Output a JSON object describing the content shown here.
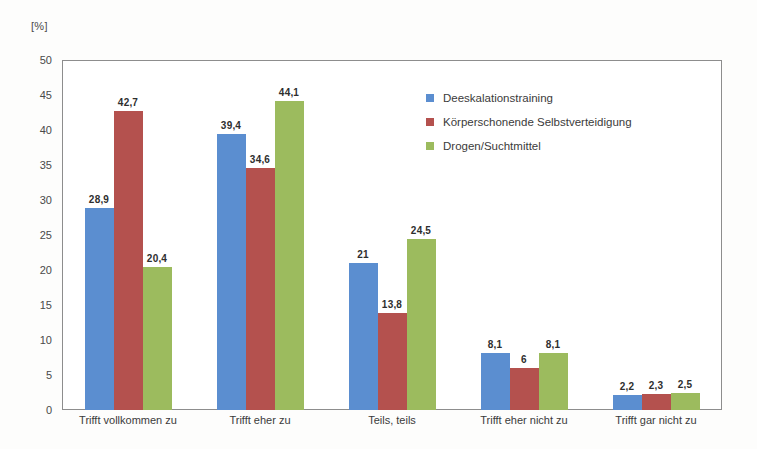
{
  "unit_label": "[%]",
  "chart_data": {
    "type": "bar",
    "title": "",
    "subtitle": "",
    "xlabel": "",
    "ylabel": "[%]",
    "ylim": [
      0,
      50
    ],
    "ytick_step": 5,
    "yticks": [
      "50",
      "45",
      "40",
      "35",
      "30",
      "25",
      "20",
      "15",
      "10",
      "5",
      "0"
    ],
    "grid": false,
    "legend_position": "inside-upper-right",
    "categories": [
      "Trifft vollkommen zu",
      "Trifft eher zu",
      "Teils, teils",
      "Trifft eher nicht zu",
      "Trifft gar nicht zu"
    ],
    "series": [
      {
        "name": "Deeskalationstraining",
        "color": "#5b8ed0",
        "values": [
          28.9,
          39.4,
          21,
          8.1,
          2.2
        ],
        "labels": [
          "28,9",
          "39,4",
          "21",
          "8,1",
          "2,2"
        ]
      },
      {
        "name": "Körperschonende Selbstverteidigung",
        "color": "#b4514e",
        "values": [
          42.7,
          34.6,
          13.8,
          6,
          2.3
        ],
        "labels": [
          "42,7",
          "34,6",
          "13,8",
          "6",
          "2,3"
        ]
      },
      {
        "name": "Drogen/Suchtmittel",
        "color": "#9cbb5e",
        "values": [
          20.4,
          44.1,
          24.5,
          8.1,
          2.5
        ],
        "labels": [
          "20,4",
          "44,1",
          "24,5",
          "8,1",
          "2,5"
        ]
      }
    ]
  }
}
